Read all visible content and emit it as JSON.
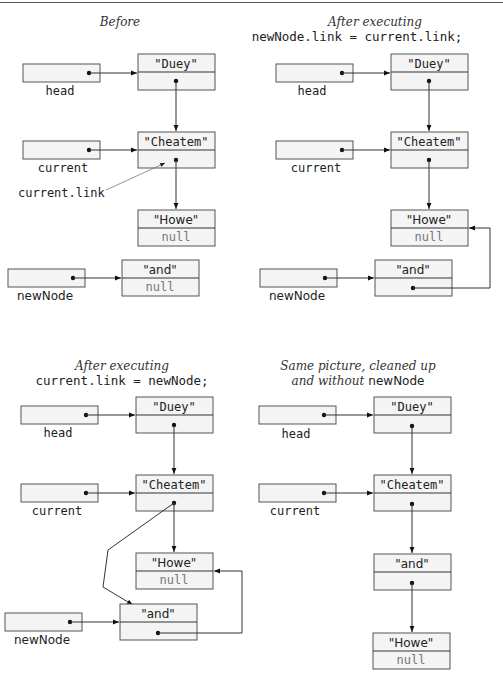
{
  "panels": [
    {
      "id": "before",
      "caption_line1": "Before",
      "caption_line2": "",
      "head_label": "head",
      "current_label": "current",
      "newnode_label": "newNode",
      "annotation": "current.link",
      "nodes": {
        "duey": {
          "data": "\"Duey\"",
          "link": ""
        },
        "cheatem": {
          "data": "\"Cheatem\"",
          "link": ""
        },
        "howe": {
          "data": "\"Howe\"",
          "link": "null"
        },
        "and": {
          "data": "\"and\"",
          "link": "null"
        }
      }
    },
    {
      "id": "after-newnode-link",
      "caption_line1": "After executing",
      "caption_line2": "newNode.link = current.link;",
      "head_label": "head",
      "current_label": "current",
      "newnode_label": "newNode",
      "nodes": {
        "duey": {
          "data": "\"Duey\"",
          "link": ""
        },
        "cheatem": {
          "data": "\"Cheatem\"",
          "link": ""
        },
        "howe": {
          "data": "\"Howe\"",
          "link": "null"
        },
        "and": {
          "data": "\"and\"",
          "link": ""
        }
      }
    },
    {
      "id": "after-current-link",
      "caption_line1": "After executing",
      "caption_line2": "current.link = newNode;",
      "head_label": "head",
      "current_label": "current",
      "newnode_label": "newNode",
      "nodes": {
        "duey": {
          "data": "\"Duey\"",
          "link": ""
        },
        "cheatem": {
          "data": "\"Cheatem\"",
          "link": ""
        },
        "howe": {
          "data": "\"Howe\"",
          "link": "null"
        },
        "and": {
          "data": "\"and\"",
          "link": ""
        }
      }
    },
    {
      "id": "cleaned-up",
      "caption_line1": "Same picture, cleaned up",
      "caption_line2_italic": "and without",
      "caption_line2_code": "newNode",
      "head_label": "head",
      "current_label": "current",
      "nodes": {
        "duey": {
          "data": "\"Duey\"",
          "link": ""
        },
        "cheatem": {
          "data": "\"Cheatem\"",
          "link": ""
        },
        "and": {
          "data": "\"and\"",
          "link": ""
        },
        "howe": {
          "data": "\"Howe\"",
          "link": "null"
        }
      }
    }
  ],
  "colors": {
    "box_fill": "#f4f4f4",
    "stroke": "#555555",
    "null_text": "#777777"
  }
}
